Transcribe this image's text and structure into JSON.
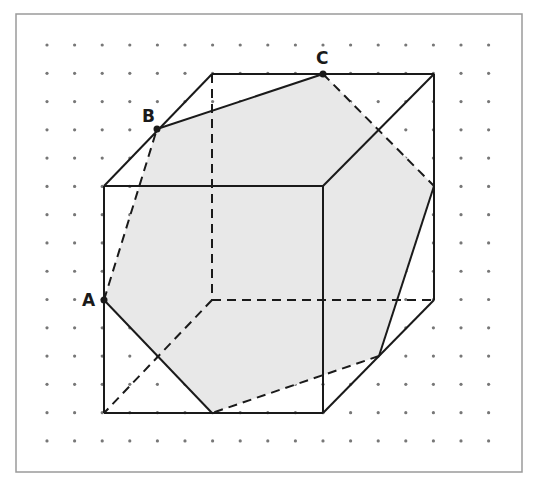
{
  "figure": {
    "frame": {
      "x": 16,
      "y": 14,
      "w": 506,
      "h": 458,
      "stroke": "#9a9a9a"
    },
    "grid": {
      "x0": 47,
      "y0": 45,
      "dx": 27.6,
      "dy": 28.28,
      "cols": 17,
      "rows": 15,
      "dot_color": "#777777"
    },
    "colors": {
      "line": "#1a1a1a",
      "fill": "#e8e8e8"
    },
    "cube": {
      "front": {
        "tl": [
          104,
          186
        ],
        "tr": [
          323,
          186
        ],
        "br": [
          323,
          413
        ],
        "bl": [
          104,
          413
        ]
      },
      "back": {
        "tl": [
          212,
          74
        ],
        "tr": [
          434,
          74
        ],
        "br": [
          434,
          300
        ],
        "bl": [
          212,
          300
        ]
      }
    },
    "section_polygon": [
      [
        104,
        300
      ],
      [
        157,
        129
      ],
      [
        323,
        74
      ],
      [
        434,
        186
      ],
      [
        379,
        356
      ],
      [
        212,
        413
      ]
    ],
    "solid_section_edges": [
      [
        [
          104,
          300
        ],
        [
          212,
          413
        ]
      ],
      [
        [
          157,
          129
        ],
        [
          323,
          74
        ]
      ],
      [
        [
          434,
          186
        ],
        [
          379,
          356
        ]
      ]
    ],
    "dashed_section_edges": [
      [
        [
          104,
          300
        ],
        [
          157,
          129
        ]
      ],
      [
        [
          323,
          74
        ],
        [
          434,
          186
        ]
      ],
      [
        [
          379,
          356
        ],
        [
          212,
          413
        ]
      ]
    ],
    "points": [
      {
        "label": "A",
        "x": 104,
        "y": 300,
        "lx": 82,
        "ly": 306
      },
      {
        "label": "B",
        "x": 157,
        "y": 129,
        "lx": 142,
        "ly": 122
      },
      {
        "label": "C",
        "x": 323,
        "y": 74,
        "lx": 316,
        "ly": 64
      }
    ]
  }
}
